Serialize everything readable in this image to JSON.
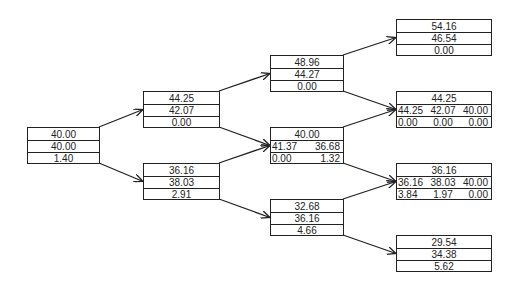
{
  "diagram": {
    "type": "binomial-tree",
    "nodes": [
      {
        "id": "n0",
        "level": 0,
        "rows": [
          [
            "40.00"
          ],
          [
            "40.00"
          ],
          [
            "1.40"
          ]
        ]
      },
      {
        "id": "n1u",
        "level": 1,
        "rows": [
          [
            "44.25"
          ],
          [
            "42.07"
          ],
          [
            "0.00"
          ]
        ]
      },
      {
        "id": "n1d",
        "level": 1,
        "rows": [
          [
            "36.16"
          ],
          [
            "38.03"
          ],
          [
            "2.91"
          ]
        ]
      },
      {
        "id": "n2uu",
        "level": 2,
        "rows": [
          [
            "48.96"
          ],
          [
            "44.27"
          ],
          [
            "0.00"
          ]
        ]
      },
      {
        "id": "n2ud",
        "level": 2,
        "rows": [
          [
            "40.00"
          ],
          [
            "41.37",
            "36.68"
          ],
          [
            "0.00",
            "1.32"
          ]
        ]
      },
      {
        "id": "n2dd",
        "level": 2,
        "rows": [
          [
            "32.68"
          ],
          [
            "36.16"
          ],
          [
            "4.66"
          ]
        ]
      },
      {
        "id": "n3uuu",
        "level": 3,
        "rows": [
          [
            "54.16"
          ],
          [
            "46.54"
          ],
          [
            "0.00"
          ]
        ]
      },
      {
        "id": "n3uud",
        "level": 3,
        "rows": [
          [
            "44.25"
          ],
          [
            "44.25",
            "42.07",
            "40.00"
          ],
          [
            "0.00",
            "0.00",
            "0.00"
          ]
        ]
      },
      {
        "id": "n3udd",
        "level": 3,
        "rows": [
          [
            "36.16"
          ],
          [
            "36.16",
            "38.03",
            "40.00"
          ],
          [
            "3.84",
            "1.97",
            "0.00"
          ]
        ]
      },
      {
        "id": "n3ddd",
        "level": 3,
        "rows": [
          [
            "29.54"
          ],
          [
            "34.38"
          ],
          [
            "5.62"
          ]
        ]
      }
    ],
    "edges": [
      [
        "n0",
        "n1u"
      ],
      [
        "n0",
        "n1d"
      ],
      [
        "n1u",
        "n2uu"
      ],
      [
        "n1u",
        "n2ud"
      ],
      [
        "n1d",
        "n2ud"
      ],
      [
        "n1d",
        "n2dd"
      ],
      [
        "n2uu",
        "n3uuu"
      ],
      [
        "n2uu",
        "n3uud"
      ],
      [
        "n2ud",
        "n3uud"
      ],
      [
        "n2ud",
        "n3udd"
      ],
      [
        "n2dd",
        "n3udd"
      ],
      [
        "n2dd",
        "n3ddd"
      ]
    ]
  }
}
